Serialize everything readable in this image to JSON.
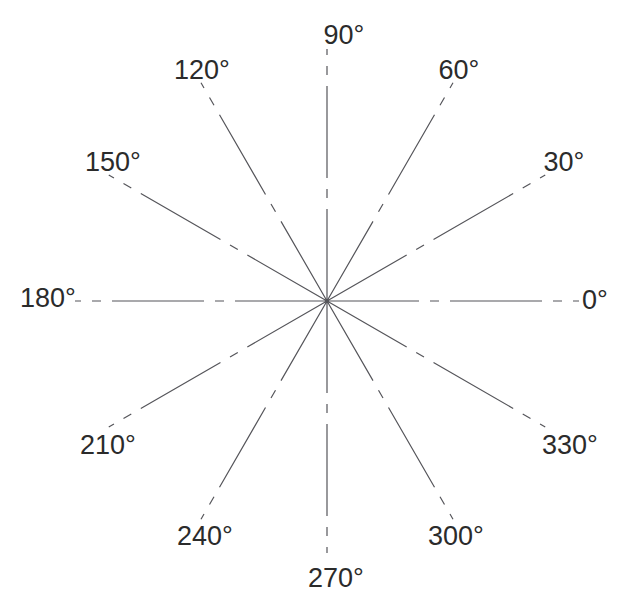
{
  "figure": {
    "kind": "polar-angle-reference",
    "background_color": "#ffffff",
    "line_color": "#55555a",
    "label_color": "#2b2b2b",
    "center": {
      "x": 327,
      "y": 301
    },
    "degree_symbol": "°"
  },
  "chart_data": {
    "type": "polar-axes",
    "title": "",
    "subtitle": "",
    "xlabel": "",
    "ylabel": "",
    "grid": false,
    "legend": null,
    "angular_unit": "degrees",
    "angular_range": [
      0,
      360
    ],
    "angular_tick_step": 30,
    "radial_ticks": [],
    "center_px": {
      "x": 327,
      "y": 301
    },
    "spoke_radius_px": 252,
    "line_style": "dash-dot",
    "line_color": "#55555a",
    "line_width_px": 1.2,
    "categories": [
      "0",
      "30",
      "60",
      "90",
      "120",
      "150",
      "180",
      "210",
      "240",
      "270",
      "300",
      "330"
    ],
    "values": [
      0,
      30,
      60,
      90,
      120,
      150,
      180,
      210,
      240,
      270,
      300,
      330
    ],
    "spokes": [
      {
        "angle": 0,
        "label": "0°",
        "label_x": 595,
        "label_y": 300,
        "radius": 252
      },
      {
        "angle": 30,
        "label": "30°",
        "label_x": 564,
        "label_y": 162,
        "radius": 252
      },
      {
        "angle": 60,
        "label": "60°",
        "label_x": 459,
        "label_y": 70,
        "radius": 252
      },
      {
        "angle": 90,
        "label": "90°",
        "label_x": 344,
        "label_y": 35,
        "radius": 252
      },
      {
        "angle": 120,
        "label": "120°",
        "label_x": 202,
        "label_y": 70,
        "radius": 252
      },
      {
        "angle": 150,
        "label": "150°",
        "label_x": 113,
        "label_y": 162,
        "radius": 252
      },
      {
        "angle": 180,
        "label": "180°",
        "label_x": 48,
        "label_y": 298,
        "radius": 252
      },
      {
        "angle": 210,
        "label": "210°",
        "label_x": 108,
        "label_y": 445,
        "radius": 252
      },
      {
        "angle": 240,
        "label": "240°",
        "label_x": 205,
        "label_y": 536,
        "radius": 252
      },
      {
        "angle": 270,
        "label": "270°",
        "label_x": 336,
        "label_y": 578,
        "radius": 252
      },
      {
        "angle": 300,
        "label": "300°",
        "label_x": 456,
        "label_y": 536,
        "radius": 252
      },
      {
        "angle": 330,
        "label": "330°",
        "label_x": 570,
        "label_y": 445,
        "radius": 252
      }
    ]
  }
}
